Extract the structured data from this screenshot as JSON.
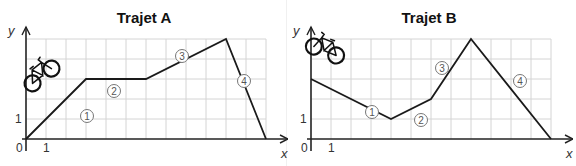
{
  "chart_data": [
    {
      "type": "line",
      "title": "Trajet A",
      "xlabel": "x",
      "ylabel": "y",
      "x_tick_labels": [
        "0",
        "1"
      ],
      "y_tick_labels": [
        "1"
      ],
      "xlim": [
        0,
        12
      ],
      "ylim": [
        0,
        5
      ],
      "grid": true,
      "points": [
        [
          0,
          0
        ],
        [
          3,
          3
        ],
        [
          6,
          3
        ],
        [
          10,
          5
        ],
        [
          12,
          0
        ]
      ],
      "segments": [
        {
          "label": "1",
          "from": [
            0,
            0
          ],
          "to": [
            3,
            3
          ]
        },
        {
          "label": "2",
          "from": [
            3,
            3
          ],
          "to": [
            6,
            3
          ]
        },
        {
          "label": "3",
          "from": [
            6,
            3
          ],
          "to": [
            10,
            5
          ]
        },
        {
          "label": "4",
          "from": [
            10,
            5
          ],
          "to": [
            12,
            0
          ]
        }
      ],
      "annotation": "bicycle-icon"
    },
    {
      "type": "line",
      "title": "Trajet B",
      "xlabel": "x",
      "ylabel": "y",
      "x_tick_labels": [
        "0",
        "1"
      ],
      "y_tick_labels": [
        "1"
      ],
      "xlim": [
        0,
        12
      ],
      "ylim": [
        0,
        5
      ],
      "grid": true,
      "points": [
        [
          0,
          3
        ],
        [
          4,
          1
        ],
        [
          6,
          2
        ],
        [
          8,
          5
        ],
        [
          12,
          0
        ]
      ],
      "segments": [
        {
          "label": "1",
          "from": [
            0,
            3
          ],
          "to": [
            4,
            1
          ]
        },
        {
          "label": "2",
          "from": [
            4,
            1
          ],
          "to": [
            6,
            2
          ]
        },
        {
          "label": "3",
          "from": [
            6,
            2
          ],
          "to": [
            8,
            5
          ]
        },
        {
          "label": "4",
          "from": [
            8,
            5
          ],
          "to": [
            12,
            0
          ]
        }
      ],
      "annotation": "bicycle-icon"
    }
  ],
  "panels": {
    "a": {
      "title": "Trajet A"
    },
    "b": {
      "title": "Trajet B"
    }
  },
  "labels": {
    "x_axis": "x",
    "y_axis": "y",
    "origin": "0",
    "x_one": "1",
    "y_one": "1",
    "seg1": "①",
    "seg2": "②",
    "seg3": "③",
    "seg4": "④"
  }
}
